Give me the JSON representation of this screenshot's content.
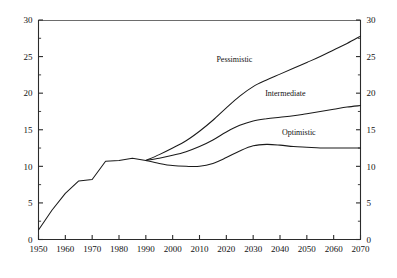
{
  "chart_data": {
    "type": "line",
    "title": "",
    "subtitle": "",
    "xlabel": "",
    "ylabel": "",
    "xlim": [
      1950,
      2070
    ],
    "ylim": [
      0,
      30
    ],
    "grid": false,
    "legend_position": "inline-annotations",
    "dual_axis": true,
    "x_ticks": [
      1950,
      1960,
      1970,
      1980,
      1990,
      2000,
      2010,
      2020,
      2030,
      2040,
      2050,
      2060,
      2070
    ],
    "x_tick_labels": [
      "1950",
      "1960",
      "1970",
      "1980",
      "1990",
      "2000",
      "2010",
      "2020",
      "2030",
      "2040",
      "2050",
      "2060",
      "2070"
    ],
    "y_ticks": [
      0,
      5,
      10,
      15,
      20,
      25,
      30
    ],
    "y_tick_labels": [
      "0",
      "5",
      "10",
      "15",
      "20",
      "25",
      "30"
    ],
    "y_minor_ticks": [
      2.5,
      7.5,
      12.5,
      17.5,
      22.5,
      27.5
    ],
    "y_ticks_right": [
      0,
      5,
      10,
      15,
      20,
      25,
      30
    ],
    "y_tick_labels_right": [
      "0",
      "5",
      "10",
      "15",
      "20",
      "25",
      "30"
    ],
    "series": [
      {
        "name": "Historical",
        "annotation": "",
        "x": [
          1950,
          1955,
          1960,
          1965,
          1970,
          1975,
          1980,
          1985,
          1990
        ],
        "values": [
          1.3,
          4.0,
          6.3,
          8.0,
          8.2,
          10.7,
          10.8,
          11.1,
          10.8
        ]
      },
      {
        "name": "Pessimistic",
        "annotation": "Pessimistic",
        "annotation_x": 2023,
        "annotation_y": 24.3,
        "x": [
          1990,
          1995,
          2000,
          2005,
          2010,
          2015,
          2020,
          2025,
          2030,
          2035,
          2040,
          2045,
          2050,
          2055,
          2060,
          2065,
          2070
        ],
        "values": [
          10.8,
          11.6,
          12.5,
          13.5,
          14.8,
          16.3,
          18.0,
          19.6,
          20.9,
          21.8,
          22.6,
          23.4,
          24.2,
          25.0,
          25.9,
          26.8,
          27.8
        ]
      },
      {
        "name": "Intermediate",
        "annotation": "Intermediate",
        "annotation_x": 2042,
        "annotation_y": 19.6,
        "x": [
          1990,
          1995,
          2000,
          2005,
          2010,
          2015,
          2020,
          2025,
          2030,
          2035,
          2040,
          2045,
          2050,
          2055,
          2060,
          2065,
          2070
        ],
        "values": [
          10.8,
          11.1,
          11.5,
          12.0,
          12.7,
          13.6,
          14.7,
          15.6,
          16.2,
          16.5,
          16.7,
          16.9,
          17.2,
          17.5,
          17.8,
          18.1,
          18.3
        ]
      },
      {
        "name": "Optimistic",
        "annotation": "Optimistic",
        "annotation_x": 2047,
        "annotation_y": 14.3,
        "x": [
          1990,
          1995,
          2000,
          2005,
          2010,
          2015,
          2020,
          2025,
          2030,
          2035,
          2040,
          2045,
          2050,
          2055,
          2060,
          2065,
          2070
        ],
        "values": [
          10.8,
          10.4,
          10.1,
          10.0,
          10.0,
          10.4,
          11.2,
          12.1,
          12.8,
          13.0,
          12.9,
          12.7,
          12.6,
          12.5,
          12.5,
          12.5,
          12.5
        ]
      }
    ]
  },
  "colors": {
    "line": "#1a1a1a",
    "axis": "#2b2b2b",
    "frame_top": "#6d6d6d",
    "background": "#ffffff",
    "text": "#111111"
  }
}
